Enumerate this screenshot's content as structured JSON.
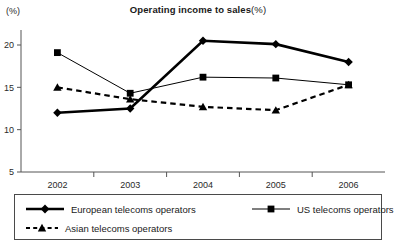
{
  "chart_data": {
    "type": "line",
    "title_bold_part": "Operating income to sales",
    "title_plain_part": "(%)",
    "ylabel": "(%)",
    "xlabel": "",
    "categories": [
      "2002",
      "2003",
      "2004",
      "2005",
      "2006"
    ],
    "yticks": [
      5,
      10,
      15,
      20
    ],
    "ylim": [
      3.2,
      22.0
    ],
    "grid": false,
    "legend_position": "below",
    "series": [
      {
        "name": "European telecoms operators",
        "marker": "diamond",
        "line_style": "solid",
        "line_width": 2.6,
        "color": "#000000",
        "values": [
          12.0,
          12.5,
          20.5,
          20.1,
          18.0
        ]
      },
      {
        "name": "US telecoms operators",
        "marker": "square",
        "line_style": "solid",
        "line_width": 1.0,
        "color": "#000000",
        "values": [
          19.1,
          14.3,
          16.2,
          16.1,
          15.3
        ]
      },
      {
        "name": "Asian telecoms operators",
        "marker": "triangle",
        "line_style": "dashed",
        "line_width": 2.2,
        "color": "#000000",
        "values": [
          15.0,
          13.6,
          12.7,
          12.3,
          15.3
        ]
      }
    ]
  },
  "legend": {
    "entries": [
      {
        "label": "European telecoms operators"
      },
      {
        "label": "US telecoms operators"
      },
      {
        "label": "Asian telecoms operators"
      }
    ]
  }
}
